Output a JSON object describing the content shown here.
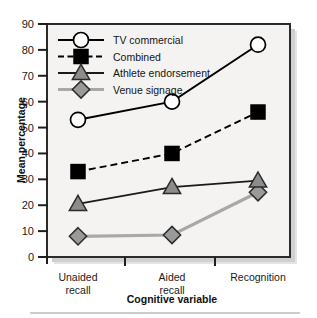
{
  "chart_data": {
    "type": "line",
    "title": "",
    "xlabel": "Cognitive variable",
    "ylabel": "Mean percentage",
    "categories": [
      "Unaided recall",
      "Aided recall",
      "Recognition"
    ],
    "category_lines": [
      [
        "Unaided",
        "recall"
      ],
      [
        "Aided",
        "recall"
      ],
      [
        "Recognition"
      ]
    ],
    "ylim": [
      0,
      90
    ],
    "yticks": [
      0,
      10,
      20,
      30,
      40,
      50,
      60,
      70,
      80,
      90
    ],
    "ytick_labels": [
      "0",
      "10",
      "20",
      "30",
      "40",
      "50",
      "60",
      "70",
      "80",
      "90"
    ],
    "grid": false,
    "legend_position": "top-left-inside",
    "series": [
      {
        "name": "TV commercial",
        "values": [
          53,
          60,
          82
        ],
        "marker": "circle",
        "marker_fill": "#ffffff",
        "line_style": "solid",
        "line_color": "#000000"
      },
      {
        "name": "Combined",
        "values": [
          33,
          40,
          56
        ],
        "marker": "square",
        "marker_fill": "#000000",
        "line_style": "dashed",
        "line_color": "#000000"
      },
      {
        "name": "Athlete endorsement",
        "values": [
          20.5,
          27,
          29.5
        ],
        "marker": "triangle",
        "marker_fill": "#8c8c8c",
        "line_style": "solid",
        "line_color": "#1a1a1a"
      },
      {
        "name": "Venue signage",
        "values": [
          8,
          8.5,
          25
        ],
        "marker": "diamond",
        "marker_fill": "#9a9a9a",
        "line_style": "solid",
        "line_color": "#a8a8a8"
      }
    ]
  },
  "colors": {
    "plot_background": "#f4f3f1",
    "page_background": "#ffffff",
    "frame": "#2b2b2b",
    "axis_text": "#1a1a1a",
    "shadow": "#b9b9b9",
    "rule": "#9a9a9a"
  },
  "footer": {
    "rule_present": true
  }
}
